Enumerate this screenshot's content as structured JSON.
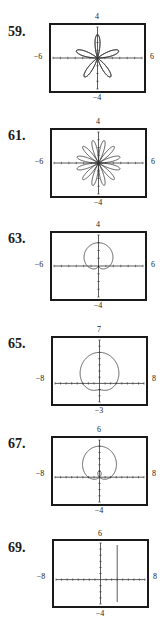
{
  "chart_data": [
    {
      "type": "line",
      "problem": "59.",
      "title": "Polar rose, 5 petals",
      "xlim": [
        -6,
        6
      ],
      "ylim": [
        -4,
        4
      ],
      "tick_labels": {
        "top": "4",
        "bottom": "−4",
        "left": "−6",
        "right": "6"
      },
      "curve": {
        "kind": "rose",
        "a": 3,
        "k": 5,
        "fn": "sin"
      },
      "grid": false
    },
    {
      "type": "line",
      "problem": "61.",
      "title": "Polar rose, 12 petals",
      "xlim": [
        -6,
        6
      ],
      "ylim": [
        -4,
        4
      ],
      "tick_labels": {
        "top": "4",
        "bottom": "−4",
        "left": "−6",
        "right": "6"
      },
      "curve": {
        "kind": "rose",
        "a": 3,
        "k": 6,
        "fn": "sin"
      },
      "grid": false
    },
    {
      "type": "line",
      "problem": "63.",
      "title": "Cardioid opening up",
      "xlim": [
        -6,
        6
      ],
      "ylim": [
        -4,
        4
      ],
      "tick_labels": {
        "top": "4",
        "bottom": "−4",
        "left": "−6",
        "right": "6"
      },
      "curve": {
        "kind": "cardioid",
        "a": 1.5,
        "b": 1.5
      },
      "grid": false
    },
    {
      "type": "line",
      "problem": "65.",
      "title": "Limaçon (convex)",
      "xlim": [
        -8,
        8
      ],
      "ylim": [
        -3,
        7
      ],
      "tick_labels": {
        "top": "7",
        "bottom": "−3",
        "left": "−8",
        "right": "8"
      },
      "curve": {
        "kind": "limacon",
        "a": 3,
        "b": 2
      },
      "grid": false
    },
    {
      "type": "line",
      "problem": "67.",
      "title": "Limaçon with inner loop",
      "xlim": [
        -8,
        8
      ],
      "ylim": [
        -4,
        6
      ],
      "tick_labels": {
        "top": "6",
        "bottom": "−4",
        "left": "−8",
        "right": "8"
      },
      "curve": {
        "kind": "limacon",
        "a": 2,
        "b": 3
      },
      "grid": false
    },
    {
      "type": "line",
      "problem": "69.",
      "title": "Vertical line x = 3",
      "xlim": [
        -8,
        8
      ],
      "ylim": [
        -4,
        6
      ],
      "tick_labels": {
        "top": "6",
        "bottom": "−4",
        "left": "−8",
        "right": "8"
      },
      "curve": {
        "kind": "vline",
        "x": 3
      },
      "grid": false
    }
  ],
  "panels": [
    {
      "num": "59.",
      "top": "4",
      "bottom": "−4",
      "left": "−6",
      "right": "6"
    },
    {
      "num": "61.",
      "top": "4",
      "bottom": "−4",
      "left": "−6",
      "right": "6"
    },
    {
      "num": "63.",
      "top": "4",
      "bottom": "−4",
      "left": "−6",
      "right": "6"
    },
    {
      "num": "65.",
      "top": "7",
      "bottom": "−3",
      "left": "−8",
      "right": "8"
    },
    {
      "num": "67.",
      "top": "6",
      "bottom": "−4",
      "left": "−8",
      "right": "8"
    },
    {
      "num": "69.",
      "top": "6",
      "bottom": "−4",
      "left": "−8",
      "right": "8"
    }
  ],
  "colors": {
    "frame": "#1a1a1a",
    "curve": "#333333",
    "axis": "#333333"
  }
}
